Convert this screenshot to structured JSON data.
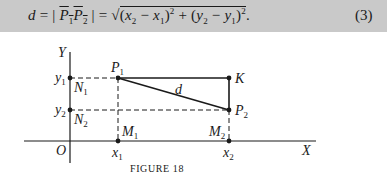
{
  "equation": {
    "lhs": "d",
    "segment": "P1P2",
    "rhs": "√((x2 − x1)² + (y2 − y1)²)",
    "number": "(3)",
    "parts": {
      "d": "d",
      "eq": "=",
      "p1": "P",
      "p1_sub": "1",
      "p2": "P",
      "p2_sub": "2",
      "x2": "x",
      "x2_sub": "2",
      "x1": "x",
      "x1_sub": "1",
      "y2": "y",
      "y2_sub": "2",
      "y1": "y",
      "y1_sub": "1",
      "exp": "2",
      "terminal": "."
    }
  },
  "figure": {
    "caption": "FIGURE 18",
    "axes": {
      "x_label": "X",
      "y_label": "Y",
      "origin_label": "O"
    },
    "points": [
      {
        "name": "P1",
        "label": "P",
        "sub": "1"
      },
      {
        "name": "P2",
        "label": "P",
        "sub": "2"
      },
      {
        "name": "K",
        "label": "K",
        "sub": ""
      },
      {
        "name": "N1",
        "label": "N",
        "sub": "1"
      },
      {
        "name": "N2",
        "label": "N",
        "sub": "2"
      },
      {
        "name": "M1",
        "label": "M",
        "sub": "1"
      },
      {
        "name": "M2",
        "label": "M",
        "sub": "2"
      }
    ],
    "ticks": {
      "x1": {
        "label": "x",
        "sub": "1"
      },
      "x2": {
        "label": "x",
        "sub": "2"
      },
      "y1": {
        "label": "y",
        "sub": "1"
      },
      "y2": {
        "label": "y",
        "sub": "2"
      }
    },
    "distance_label": "d"
  }
}
